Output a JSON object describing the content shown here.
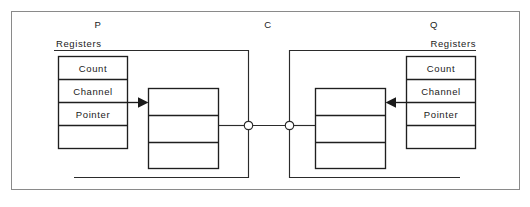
{
  "figure": {
    "width": 530,
    "height": 207,
    "background": "#ffffff",
    "line_color": "#1f1f1f",
    "frame_color": "#8a8a8a",
    "text_color": "#1a1a1a"
  },
  "nodes": {
    "producer": {
      "label": "P"
    },
    "channel": {
      "label": "C"
    },
    "consumer": {
      "label": "Q"
    }
  },
  "producer_side": {
    "group_label": "Registers",
    "registers": [
      {
        "label": "Count"
      },
      {
        "label": "Channel"
      },
      {
        "label": "Pointer"
      },
      {
        "label": ""
      }
    ],
    "buffer": {
      "slots": [
        "",
        "",
        ""
      ]
    },
    "arrow_direction": "right"
  },
  "consumer_side": {
    "group_label": "Registers",
    "registers": [
      {
        "label": "Count"
      },
      {
        "label": "Channel"
      },
      {
        "label": "Pointer"
      },
      {
        "label": ""
      }
    ],
    "buffer": {
      "slots": [
        "",
        "",
        ""
      ]
    },
    "arrow_direction": "left"
  },
  "channel_link": {
    "left_port": "port-dot",
    "right_port": "port-dot",
    "connector": "channel-wire"
  }
}
